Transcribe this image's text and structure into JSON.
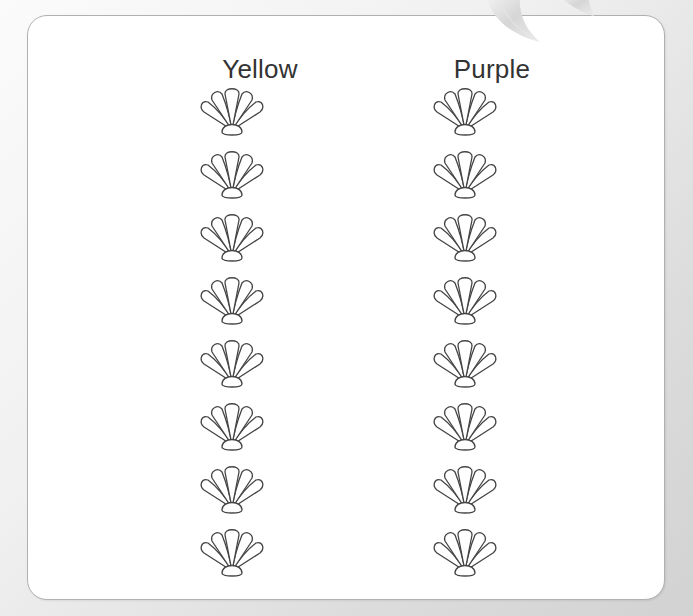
{
  "worksheet": {
    "columns": [
      {
        "label": "Yellow",
        "shell_count": 8,
        "shell_icon": "seashell-outline-icon"
      },
      {
        "label": "Purple",
        "shell_count": 8,
        "shell_icon": "seashell-outline-icon"
      }
    ],
    "decoration": "curled-ribbon-corner",
    "colors": {
      "card_background": "#ffffff",
      "card_border": "#b0b0b0",
      "page_background": "#d9d9d9",
      "heading_text": "#333333",
      "shell_stroke": "#444444"
    }
  }
}
